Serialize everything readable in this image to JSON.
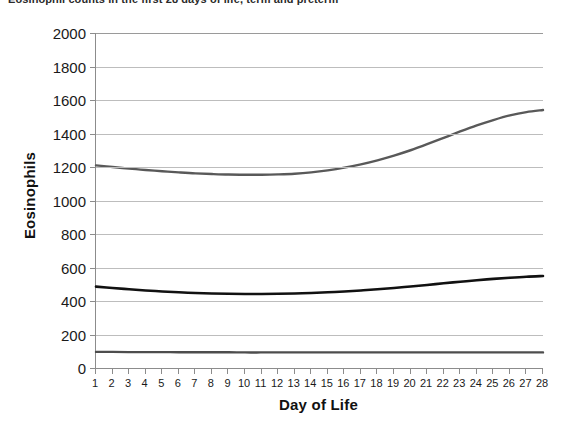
{
  "caption": "Eosinophil counts in the first 28 days of life, term and preterm",
  "chart_data": {
    "type": "line",
    "title": "Eosinophil counts in the first 28 days of life, term and preterm",
    "xlabel": "Day of Life",
    "ylabel": "Eosinophils",
    "xlim": [
      1,
      28
    ],
    "ylim": [
      0,
      2000
    ],
    "ytick_step": 200,
    "grid": true,
    "legend": "none",
    "x": [
      1,
      2,
      3,
      4,
      5,
      6,
      7,
      8,
      9,
      10,
      11,
      12,
      13,
      14,
      15,
      16,
      17,
      18,
      19,
      20,
      21,
      22,
      23,
      24,
      25,
      26,
      27,
      28
    ],
    "yticks": [
      0,
      200,
      400,
      600,
      800,
      1000,
      1200,
      1400,
      1600,
      1800,
      2000
    ],
    "xticks": [
      1,
      2,
      3,
      4,
      5,
      6,
      7,
      8,
      9,
      10,
      11,
      12,
      13,
      14,
      15,
      16,
      17,
      18,
      19,
      20,
      21,
      22,
      23,
      24,
      25,
      26,
      27,
      28
    ],
    "series": [
      {
        "name": "upper-reference-curve",
        "color": "#595959",
        "width": 2.4,
        "values": [
          1210,
          1200,
          1190,
          1182,
          1175,
          1168,
          1162,
          1158,
          1155,
          1154,
          1154,
          1156,
          1160,
          1168,
          1180,
          1196,
          1216,
          1240,
          1268,
          1300,
          1336,
          1374,
          1412,
          1448,
          1480,
          1508,
          1528,
          1540
        ]
      },
      {
        "name": "mean-curve",
        "color": "#111111",
        "width": 2.6,
        "values": [
          486,
          478,
          470,
          463,
          457,
          452,
          448,
          445,
          443,
          442,
          442,
          443,
          445,
          448,
          452,
          457,
          463,
          470,
          478,
          487,
          496,
          506,
          515,
          524,
          532,
          539,
          545,
          549
        ]
      },
      {
        "name": "lower-reference-curve",
        "color": "#4d4d4d",
        "width": 2.4,
        "values": [
          96,
          96,
          95,
          95,
          95,
          94,
          94,
          94,
          94,
          93,
          93,
          93,
          93,
          93,
          93,
          93,
          93,
          93,
          93,
          93,
          93,
          93,
          93,
          93,
          93,
          93,
          93,
          93
        ]
      }
    ]
  },
  "colors": {
    "gridline": "#bdbdbd",
    "axis": "#8c8c8c",
    "text": "#1a1a1a",
    "background": "#ffffff"
  }
}
